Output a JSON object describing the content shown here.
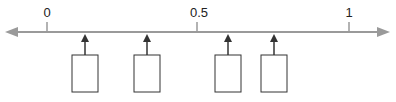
{
  "number_line": {
    "min": 0,
    "max": 1,
    "line_color": "#9a9a9a",
    "ticks": [
      {
        "value": 0,
        "label": "0"
      },
      {
        "value": 0.5,
        "label": "0.5"
      },
      {
        "value": 1,
        "label": "1"
      }
    ],
    "answer_boxes": [
      {
        "approx_value": 0.125,
        "content": ""
      },
      {
        "approx_value": 0.33,
        "content": ""
      },
      {
        "approx_value": 0.6,
        "content": ""
      },
      {
        "approx_value": 0.75,
        "content": ""
      }
    ]
  }
}
